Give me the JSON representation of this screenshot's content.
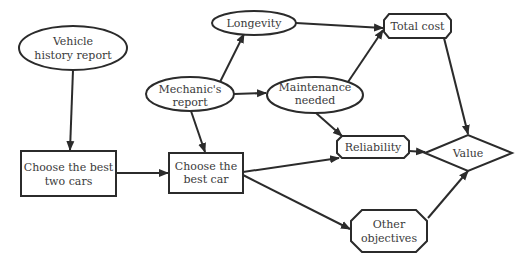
{
  "nodes": {
    "vehicle_history": {
      "line1": "Vehicle",
      "line2": "history report",
      "shape": "ellipse"
    },
    "mechanic": {
      "line1": "Mechanic's",
      "line2": "report",
      "shape": "ellipse"
    },
    "longevity": {
      "line1": "Longevity",
      "shape": "ellipse"
    },
    "maintenance": {
      "line1": "Maintenance",
      "line2": "needed",
      "shape": "ellipse"
    },
    "total_cost": {
      "line1": "Total cost",
      "shape": "octagon"
    },
    "best_two": {
      "line1": "Choose the best",
      "line2": "two cars",
      "shape": "rectangle"
    },
    "best_car": {
      "line1": "Choose the",
      "line2": "best car",
      "shape": "rectangle"
    },
    "reliability": {
      "line1": "Reliability",
      "shape": "octagon"
    },
    "value": {
      "line1": "Value",
      "shape": "diamond"
    },
    "other": {
      "line1": "Other",
      "line2": "objectives",
      "shape": "octagon"
    }
  },
  "edges": [
    [
      "Vehicle history report",
      "Choose the best two cars"
    ],
    [
      "Choose the best two cars",
      "Choose the best car"
    ],
    [
      "Mechanic's report",
      "Choose the best car"
    ],
    [
      "Mechanic's report",
      "Longevity"
    ],
    [
      "Mechanic's report",
      "Maintenance needed"
    ],
    [
      "Longevity",
      "Total cost"
    ],
    [
      "Maintenance needed",
      "Total cost"
    ],
    [
      "Maintenance needed",
      "Reliability"
    ],
    [
      "Choose the best car",
      "Reliability"
    ],
    [
      "Choose the best car",
      "Other objectives"
    ],
    [
      "Total cost",
      "Value"
    ],
    [
      "Reliability",
      "Value"
    ],
    [
      "Other objectives",
      "Value"
    ]
  ]
}
